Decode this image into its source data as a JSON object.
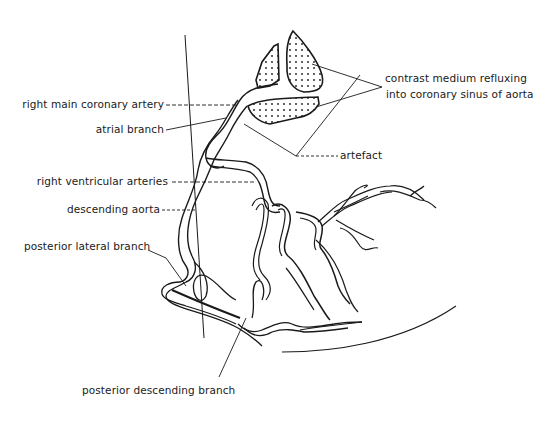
{
  "figure": {
    "type": "anatomical line drawing"
  },
  "labels": {
    "right_main_coronary_artery": "right main coronary artery",
    "atrial_branch": "atrial branch",
    "right_ventricular_arteries": "right ventricular arteries",
    "descending_aorta": "descending aorta",
    "posterior_lateral_branch": "posterior lateral branch",
    "posterior_descending_branch": "posterior descending branch",
    "contrast_line1": "contrast medium refluxing",
    "contrast_line2": "into coronary sinus of aorta",
    "artefact": "artefact"
  },
  "colors": {
    "ink": "#1a1a1a",
    "background": "#ffffff"
  }
}
